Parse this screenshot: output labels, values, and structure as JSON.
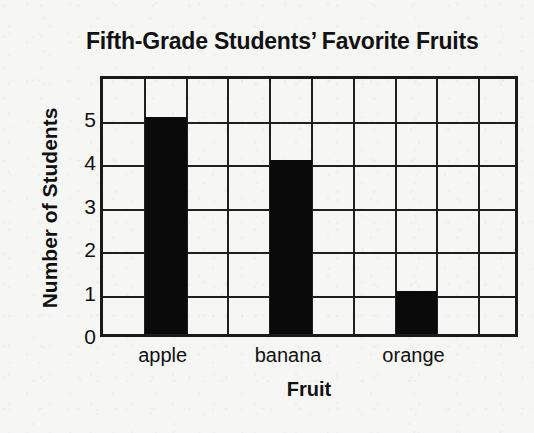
{
  "chart_data": {
    "type": "bar",
    "title": "Fifth-Grade Students’ Favorite Fruits",
    "xlabel": "Fruit",
    "ylabel": "Number of Students",
    "categories": [
      "apple",
      "banana",
      "orange"
    ],
    "values": [
      5,
      4,
      1
    ],
    "series": [
      {
        "name": "Number of Students",
        "values": [
          5,
          4,
          1
        ]
      }
    ],
    "ylim": [
      0,
      6
    ],
    "yticks": [
      0,
      1,
      2,
      3,
      4,
      5
    ],
    "ytick_labels": [
      "0",
      "1",
      "2",
      "3",
      "4",
      "5"
    ],
    "grid": true,
    "grid_columns": 10,
    "grid_rows": 6,
    "bar_columns": [
      2,
      5,
      8
    ],
    "legend": null,
    "bar_color": "#0a0a0a",
    "grid_color": "#1f1f1f",
    "axis_color": "#1a1a1a",
    "background_color": "#f6f6f4",
    "text_color": "#111111"
  }
}
